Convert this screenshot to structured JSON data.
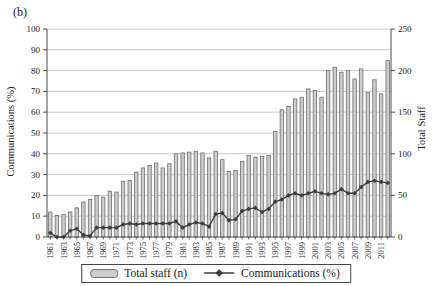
{
  "panel_label": "(b)",
  "chart_data": {
    "type": "combo",
    "title": "",
    "x": [
      1961,
      1962,
      1963,
      1964,
      1965,
      1966,
      1967,
      1968,
      1969,
      1970,
      1971,
      1972,
      1973,
      1974,
      1975,
      1976,
      1977,
      1978,
      1979,
      1980,
      1981,
      1982,
      1983,
      1984,
      1985,
      1986,
      1987,
      1988,
      1989,
      1990,
      1991,
      1992,
      1993,
      1994,
      1995,
      1996,
      1997,
      1998,
      1999,
      2000,
      2001,
      2002,
      2003,
      2004,
      2005,
      2006,
      2007,
      2008,
      2009,
      2010,
      2011,
      2012
    ],
    "x_tick_labels": [
      "1961",
      "1963",
      "1965",
      "1967",
      "1969",
      "1971",
      "1973",
      "1975",
      "1977",
      "1979",
      "1981",
      "1983",
      "1985",
      "1987",
      "1989",
      "1991",
      "1993",
      "1995",
      "1997",
      "1999",
      "2001",
      "2003",
      "2005",
      "2007",
      "2009",
      "2011"
    ],
    "series": [
      {
        "name": "Total staff (n)",
        "type": "bar",
        "axis": "right",
        "values": [
          30,
          26,
          27,
          30,
          35,
          42,
          45,
          50,
          48,
          55,
          54,
          67,
          68,
          78,
          83,
          86,
          89,
          83,
          88,
          100,
          101,
          102,
          103,
          101,
          95,
          103,
          93,
          79,
          80,
          91,
          98,
          96,
          97,
          98,
          127,
          153,
          157,
          166,
          168,
          178,
          176,
          168,
          200,
          204,
          198,
          200,
          190,
          202,
          174,
          189,
          172,
          212
        ]
      },
      {
        "name": "Communications (%)",
        "type": "line",
        "marker": "diamond",
        "axis": "left",
        "values": [
          2,
          0,
          0,
          3,
          4,
          1,
          0.5,
          4.5,
          4.5,
          4.5,
          4.5,
          6,
          6.5,
          6,
          6.5,
          6.5,
          6.5,
          6.5,
          6.5,
          7.5,
          4.5,
          6,
          7,
          6.5,
          5,
          11,
          11.5,
          8,
          8.5,
          12.5,
          13.5,
          14,
          12,
          13.5,
          17,
          18,
          20,
          21,
          20,
          21,
          22,
          21,
          20.5,
          21,
          23,
          21,
          21,
          24,
          26.5,
          27,
          26.5,
          26
        ]
      }
    ],
    "left_axis": {
      "label": "Communications (%)",
      "min": 0,
      "max": 100,
      "tick_step": 10
    },
    "right_axis": {
      "label": "Total Staff",
      "min": 0,
      "max": 250,
      "tick_step": 50
    },
    "grid": true,
    "legend_position": "bottom",
    "colors": {
      "bar_fill": "#cdcdcd",
      "bar_stroke": "#6e6e6e",
      "line": "#3d3d3d",
      "grid": "#b3b3b3",
      "axis": "#4a4a4a",
      "text": "#1a1a1a",
      "background": "#ffffff"
    }
  }
}
